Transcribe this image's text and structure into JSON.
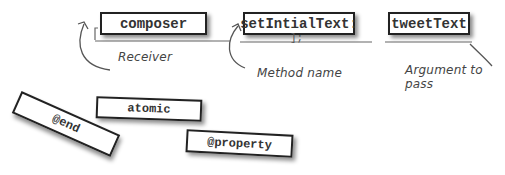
{
  "message_expression": {
    "receiver": "composer",
    "method": "setIntialText:",
    "argument": "tweetText",
    "method_trailing": "];"
  },
  "annotations": {
    "receiver": "Receiver",
    "method": "Method name",
    "argument": "Argument to pass"
  },
  "loose_cards": [
    {
      "label": "@end"
    },
    {
      "label": "atomic"
    },
    {
      "label": "@property"
    }
  ],
  "colors": {
    "ink": "#222222",
    "text": "#333333",
    "line": "#555555",
    "background": "#ffffff"
  }
}
